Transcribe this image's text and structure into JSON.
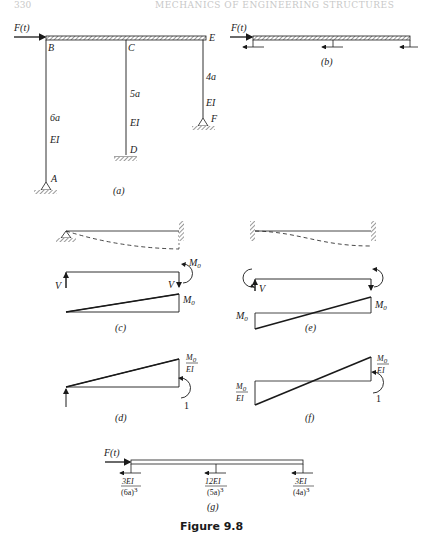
{
  "header": {
    "page_number": "330",
    "running_title": "MECHANICS OF ENGINEERING STRUCTURES"
  },
  "figure": {
    "caption": "Figure 9.8",
    "panels": {
      "a": {
        "label": "(a)",
        "force": "F(t)",
        "nodes": [
          "A",
          "B",
          "C",
          "D",
          "E",
          "F"
        ],
        "columns": [
          {
            "from": "B",
            "to": "A",
            "length": "6a",
            "stiffness": "EI",
            "support": "pin"
          },
          {
            "from": "C",
            "to": "D",
            "length": "5a",
            "stiffness": "EI",
            "support": "fixed"
          },
          {
            "from": "E",
            "to": "F",
            "length": "4a",
            "stiffness": "EI",
            "support": "pin"
          }
        ]
      },
      "b": {
        "label": "(b)",
        "force": "F(t)"
      },
      "c": {
        "label": "(c)",
        "shear": "V",
        "moment": "M",
        "moment_sub": "0"
      },
      "d": {
        "label": "(d)",
        "moment_num": "M",
        "moment_sub": "0",
        "moment_den": "EI",
        "unit_moment": "1"
      },
      "e": {
        "label": "(e)",
        "shear": "V",
        "moment": "M",
        "moment_sub": "0"
      },
      "f": {
        "label": "(f)",
        "moment_num": "M",
        "moment_sub": "0",
        "moment_den": "EI",
        "unit_moment": "1"
      },
      "g": {
        "label": "(g)",
        "force": "F(t)",
        "springs": [
          {
            "num": "3EI",
            "den": "(6a)",
            "exp": "3"
          },
          {
            "num": "12EI",
            "den": "(5a)",
            "exp": "3"
          },
          {
            "num": "3EI",
            "den": "(4a)",
            "exp": "3"
          }
        ]
      }
    }
  }
}
